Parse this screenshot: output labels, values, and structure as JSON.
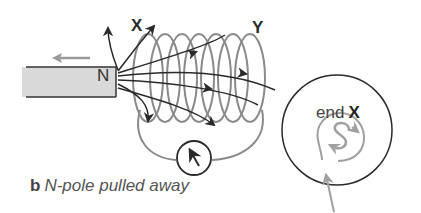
{
  "diagram": {
    "labels": {
      "coil_end_left": "X",
      "coil_end_right": "Y",
      "magnet_pole": "N"
    },
    "caption": {
      "part": "b",
      "text": "N-pole pulled away"
    },
    "end_view": {
      "prefix": "end",
      "end_name": "X",
      "induced_pole": "S"
    },
    "colors": {
      "field_lines": "#2a2a2a",
      "coil": "#8a8a8a",
      "magnet_fill": "#d9d9d9",
      "motion_arrow": "#9a9a9a",
      "current_arrow": "#a0a0a0"
    }
  }
}
